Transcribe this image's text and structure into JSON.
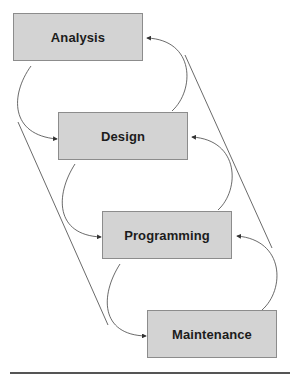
{
  "diagram": {
    "type": "waterfall-process",
    "stages": [
      {
        "label": "Analysis"
      },
      {
        "label": "Design"
      },
      {
        "label": "Programming"
      },
      {
        "label": "Maintenance"
      }
    ],
    "forward_arrows": [
      {
        "from": "Analysis",
        "to": "Design"
      },
      {
        "from": "Design",
        "to": "Programming"
      },
      {
        "from": "Programming",
        "to": "Maintenance"
      }
    ],
    "feedback_arrows": [
      {
        "from": "Design",
        "to": "Analysis"
      },
      {
        "from": "Programming",
        "to": "Design"
      },
      {
        "from": "Maintenance",
        "to": "Programming"
      }
    ],
    "colors": {
      "box_fill": "#d3d3d3",
      "box_border": "#8c8c8c",
      "line": "#333333"
    }
  }
}
